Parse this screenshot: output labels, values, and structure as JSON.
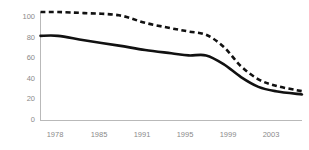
{
  "chart_data": {
    "type": "line",
    "title": "",
    "subtitle": "",
    "xlabel": "",
    "ylabel": "",
    "xlim": [
      1976,
      2006
    ],
    "ylim": [
      0,
      100
    ],
    "grid": false,
    "legend": "none",
    "x_tick_labels": [
      "1978",
      "1985",
      "1991",
      "1995",
      "1999",
      "2003"
    ],
    "x_tick_values": [
      1978,
      1985,
      1991,
      1995,
      1999,
      2003
    ],
    "y_tick_labels": [
      "0",
      "20",
      "40",
      "60",
      "80",
      "100"
    ],
    "y_tick_values": [
      0,
      20,
      40,
      60,
      80,
      100
    ],
    "series": [
      {
        "name": "dashed-series",
        "style": "dashed",
        "color": "#111111",
        "x": [
          1976,
          1978,
          1981,
          1985,
          1988,
          1991,
          1993,
          1995,
          1997,
          1999,
          2001,
          2003,
          2006
        ],
        "values": [
          100,
          100,
          99,
          97,
          90,
          85,
          82,
          79,
          68,
          50,
          38,
          32,
          27
        ]
      },
      {
        "name": "solid-series",
        "style": "solid",
        "color": "#111111",
        "x": [
          1976,
          1978,
          1981,
          1985,
          1988,
          1991,
          1993,
          1995,
          1997,
          1999,
          2001,
          2003,
          2006
        ],
        "values": [
          78,
          78,
          74,
          69,
          65,
          62,
          60,
          60,
          52,
          40,
          31,
          27,
          24
        ]
      }
    ]
  },
  "axes": {
    "spine_color": "#b9b9b9",
    "tick_label_color": "#8a8a8a"
  }
}
